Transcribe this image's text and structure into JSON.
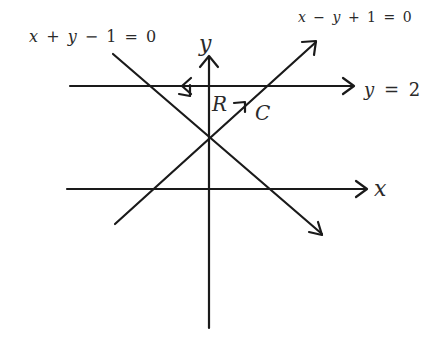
{
  "diagram": {
    "type": "coordinate-plane-region",
    "axes": {
      "x_label": "x",
      "y_label": "y"
    },
    "lines": [
      {
        "id": "line1",
        "equation": "x + y − 1 = 0",
        "label_parts": [
          "x",
          "+",
          "y",
          "−",
          "1",
          "=",
          "0"
        ]
      },
      {
        "id": "line2",
        "equation": "x − y + 1 = 0",
        "label_parts": [
          "x",
          "−",
          "y",
          "+",
          "1",
          "=",
          "0"
        ]
      },
      {
        "id": "line3",
        "equation": "y = 2",
        "label_parts": [
          "y",
          "=",
          "2"
        ]
      }
    ],
    "region_label": "R",
    "curve_label": "C",
    "colors": {
      "background": "#ffffff",
      "ink": "#1a1a1a",
      "text": "#2a2a2a"
    }
  }
}
